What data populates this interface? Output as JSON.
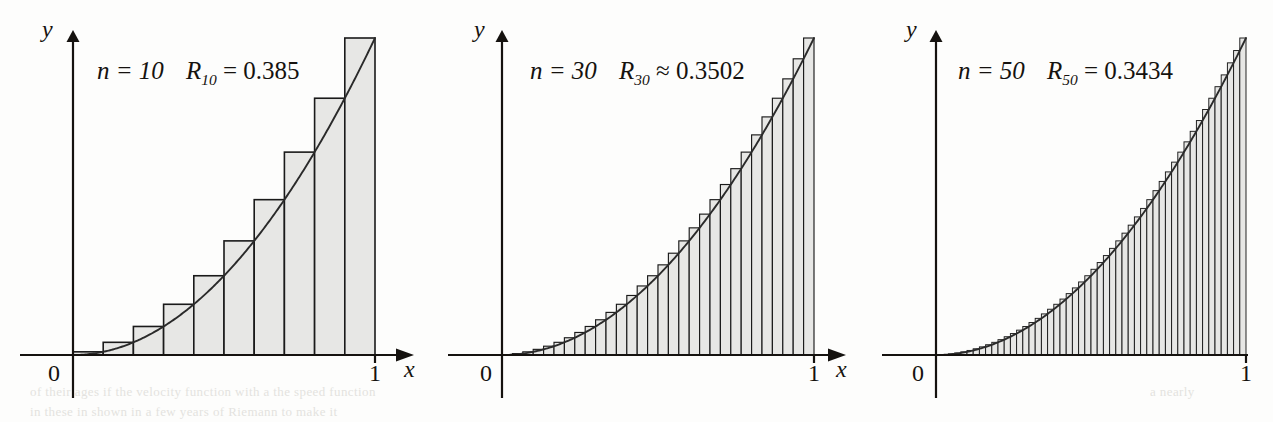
{
  "figure": {
    "caption_present": false,
    "background_color": "#fdfdfc",
    "ink_color": "#15120f",
    "bar_fill_color": "#e7e7e5",
    "bar_stroke_color": "#1a1a1a",
    "curve_color": "#2a2a2a"
  },
  "panels": [
    {
      "id": "panel-n10",
      "label": {
        "n_text": "n = 10",
        "r_symbol": "R",
        "r_subscript": "10",
        "relation": "=",
        "r_value": "0.385",
        "full_text": "n = 10   R10 = 0.385"
      },
      "axes": {
        "y_label": "y",
        "x_label": "x",
        "origin_label": "0",
        "x_tick_label": "1",
        "x_arrow": true,
        "y_arrow": true
      }
    },
    {
      "id": "panel-n30",
      "label": {
        "n_text": "n = 30",
        "r_symbol": "R",
        "r_subscript": "30",
        "relation": "≈",
        "r_value": "0.3502",
        "full_text": "n = 30   R30 ≈ 0.3502"
      },
      "axes": {
        "y_label": "y",
        "x_label": "x",
        "origin_label": "0",
        "x_tick_label": "1",
        "x_arrow": true,
        "y_arrow": true
      }
    },
    {
      "id": "panel-n50",
      "label": {
        "n_text": "n = 50",
        "r_symbol": "R",
        "r_subscript": "50",
        "relation": "=",
        "r_value": "0.3434",
        "full_text": "n = 50   R50 = 0.3434"
      },
      "axes": {
        "y_label": "y",
        "x_label": "",
        "origin_label": "0",
        "x_tick_label": "1",
        "x_arrow": false,
        "y_arrow": true
      }
    }
  ],
  "bleed_through": [
    {
      "text": "of their ages if the velocity function with a the speed function",
      "x": 30,
      "y": 384
    },
    {
      "text": "in these in shown in a few years of Riemann to make it",
      "x": 30,
      "y": 404
    },
    {
      "text": "a  nearly",
      "x": 1150,
      "y": 384
    }
  ],
  "chart_data": {
    "type": "bar",
    "title": "",
    "subtitle": "",
    "xlabel": "x",
    "ylabel": "y",
    "xlim": [
      0,
      1
    ],
    "ylim": [
      0,
      1
    ],
    "grid": false,
    "legend": "none",
    "function": "y = x^2",
    "method": "right endpoint Riemann sum",
    "annotations": [
      "n = 10   R10 = 0.385",
      "n = 30   R30 ≈ 0.3502",
      "n = 50   R50 = 0.3434"
    ],
    "panels": [
      {
        "name": "n = 10",
        "n": 10,
        "riemann_sum": 0.385,
        "relation": "=",
        "x_right_endpoints": [
          0.1,
          0.2,
          0.3,
          0.4,
          0.5,
          0.6,
          0.7,
          0.8,
          0.9,
          1.0
        ],
        "bar_heights": [
          0.01,
          0.04,
          0.09,
          0.16,
          0.25,
          0.36,
          0.49,
          0.64,
          0.81,
          1.0
        ]
      },
      {
        "name": "n = 30",
        "n": 30,
        "riemann_sum": 0.3502,
        "relation": "≈",
        "x_right_endpoints": [
          0.0333,
          0.0667,
          0.1,
          0.1333,
          0.1667,
          0.2,
          0.2333,
          0.2667,
          0.3,
          0.3333,
          0.3667,
          0.4,
          0.4333,
          0.4667,
          0.5,
          0.5333,
          0.5667,
          0.6,
          0.6333,
          0.6667,
          0.7,
          0.7333,
          0.7667,
          0.8,
          0.8333,
          0.8667,
          0.9,
          0.9333,
          0.9667,
          1.0
        ],
        "bar_heights": [
          0.0011,
          0.0044,
          0.01,
          0.0178,
          0.0278,
          0.04,
          0.0544,
          0.0711,
          0.09,
          0.1111,
          0.1344,
          0.16,
          0.1878,
          0.2178,
          0.25,
          0.2844,
          0.3211,
          0.36,
          0.4011,
          0.4444,
          0.49,
          0.5378,
          0.5878,
          0.64,
          0.6944,
          0.7511,
          0.81,
          0.8711,
          0.9344,
          1.0
        ]
      },
      {
        "name": "n = 50",
        "n": 50,
        "riemann_sum": 0.3434,
        "relation": "=",
        "x_right_endpoints": [
          0.02,
          0.04,
          0.06,
          0.08,
          0.1,
          0.12,
          0.14,
          0.16,
          0.18,
          0.2,
          0.22,
          0.24,
          0.26,
          0.28,
          0.3,
          0.32,
          0.34,
          0.36,
          0.38,
          0.4,
          0.42,
          0.44,
          0.46,
          0.48,
          0.5,
          0.52,
          0.54,
          0.56,
          0.58,
          0.6,
          0.62,
          0.64,
          0.66,
          0.68,
          0.7,
          0.72,
          0.74,
          0.76,
          0.78,
          0.8,
          0.82,
          0.84,
          0.86,
          0.88,
          0.9,
          0.92,
          0.94,
          0.96,
          0.98,
          1.0
        ],
        "bar_heights": [
          0.0004,
          0.0016,
          0.0036,
          0.0064,
          0.01,
          0.0144,
          0.0196,
          0.0256,
          0.0324,
          0.04,
          0.0484,
          0.0576,
          0.0676,
          0.0784,
          0.09,
          0.1024,
          0.1156,
          0.1296,
          0.1444,
          0.16,
          0.1764,
          0.1936,
          0.2116,
          0.2304,
          0.25,
          0.2704,
          0.2916,
          0.3136,
          0.3364,
          0.36,
          0.3844,
          0.4096,
          0.4356,
          0.4624,
          0.49,
          0.5184,
          0.5476,
          0.5776,
          0.6084,
          0.64,
          0.6724,
          0.7056,
          0.7396,
          0.7744,
          0.81,
          0.8464,
          0.8836,
          0.9216,
          0.9604,
          1.0
        ]
      }
    ]
  }
}
